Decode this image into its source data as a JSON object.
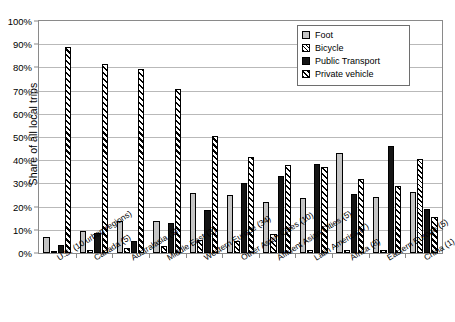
{
  "chart_data": {
    "type": "bar",
    "title": "",
    "xlabel": "",
    "ylabel": "Share of all local trips",
    "ylim": [
      0,
      100
    ],
    "ytick_labels": [
      "0%",
      "10%",
      "20%",
      "30%",
      "40%",
      "50%",
      "60%",
      "70%",
      "80%",
      "90%",
      "100%"
    ],
    "ytick_values": [
      0,
      10,
      20,
      30,
      40,
      50,
      60,
      70,
      80,
      90,
      100
    ],
    "grid": true,
    "legend_position": "top-right",
    "categories": [
      "U.S. (10 urban regions)",
      "Canada (5)",
      "Australasia (5)",
      "Middle East (3)",
      "Western Europe (34)",
      "Other Asian Cities (10)",
      "Affluent Asian Cities (5)",
      "Latin America (7)",
      "Africa (8)",
      "Eastern Europe (5)",
      "China (1)"
    ],
    "series": [
      {
        "name": "Foot",
        "values": [
          7.0,
          9.5,
          14.0,
          14.0,
          26.0,
          24.8,
          22.0,
          23.8,
          43.0,
          24.0,
          26.5
        ]
      },
      {
        "name": "Bicycle",
        "values": [
          0.9,
          1.2,
          2.0,
          3.0,
          5.5,
          5.0,
          8.0,
          1.5,
          1.5,
          1.5,
          40.5
        ]
      },
      {
        "name": "Public Transport",
        "values": [
          3.3,
          8.8,
          5.0,
          13.0,
          18.5,
          30.0,
          33.0,
          38.5,
          25.5,
          46.0,
          19.0
        ]
      },
      {
        "name": "Private vehicle",
        "values": [
          89.0,
          81.3,
          79.5,
          70.5,
          50.5,
          41.5,
          38.0,
          37.0,
          31.8,
          28.8,
          15.5
        ]
      }
    ],
    "legend": [
      "Foot",
      "Bicycle",
      "Public Transport",
      "Private vehicle"
    ],
    "colors": {
      "foot": "#c4c4c4",
      "bicycle": "#ffffff",
      "transport": "#141414",
      "vehicle": "#ffffff",
      "axis": "#8a8a8a",
      "grid": "#b9b9b9",
      "outline": "#000000"
    }
  }
}
